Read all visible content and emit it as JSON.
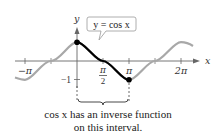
{
  "figure": {
    "curve_label": "y = cos x",
    "axis_x_label": "x",
    "axis_y_label": "y",
    "x_ticks": [
      "−π",
      "π",
      "2π"
    ],
    "x_tick_half_pi": {
      "numerator": "π",
      "denominator": "2"
    },
    "y_ticks": [
      "−1"
    ],
    "caption_line1": "cos x has an inverse function",
    "caption_line2": "on this interval.",
    "colors": {
      "curve_full": "#a6a6a6",
      "curve_highlight": "#000000",
      "axis": "#555555",
      "label_border": "#9a9a9a"
    },
    "highlighted_interval": [
      "0",
      "π"
    ]
  }
}
